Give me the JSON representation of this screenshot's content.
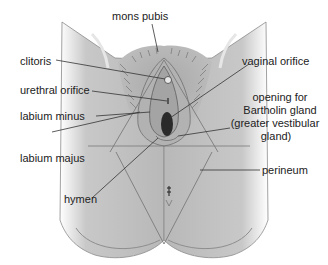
{
  "diagram": {
    "type": "anatomical-illustration",
    "colors": {
      "skin": "#b4b4b4",
      "skin_light": "#d4d4d4",
      "outline": "#6e6e6e",
      "leader_line": "#333333",
      "orifice": "#2a2a2a",
      "background": "#ffffff"
    },
    "labels": [
      {
        "id": "mons_pubis",
        "text": "mons pubis"
      },
      {
        "id": "clitoris",
        "text": "clitoris"
      },
      {
        "id": "urethral_orifice",
        "text": "urethral orifice"
      },
      {
        "id": "labium_minus",
        "text": "labium minus"
      },
      {
        "id": "labium_majus",
        "text": "labium majus"
      },
      {
        "id": "hymen",
        "text": "hymen"
      },
      {
        "id": "vaginal_orifice",
        "text": "vaginal orifice"
      },
      {
        "id": "bartholin_line1",
        "text": "opening for"
      },
      {
        "id": "bartholin_line2",
        "text": "Bartholin gland"
      },
      {
        "id": "bartholin_line3",
        "text": "(greater vestibular"
      },
      {
        "id": "bartholin_line4",
        "text": "gland)"
      },
      {
        "id": "perineum",
        "text": "perineum"
      }
    ]
  }
}
